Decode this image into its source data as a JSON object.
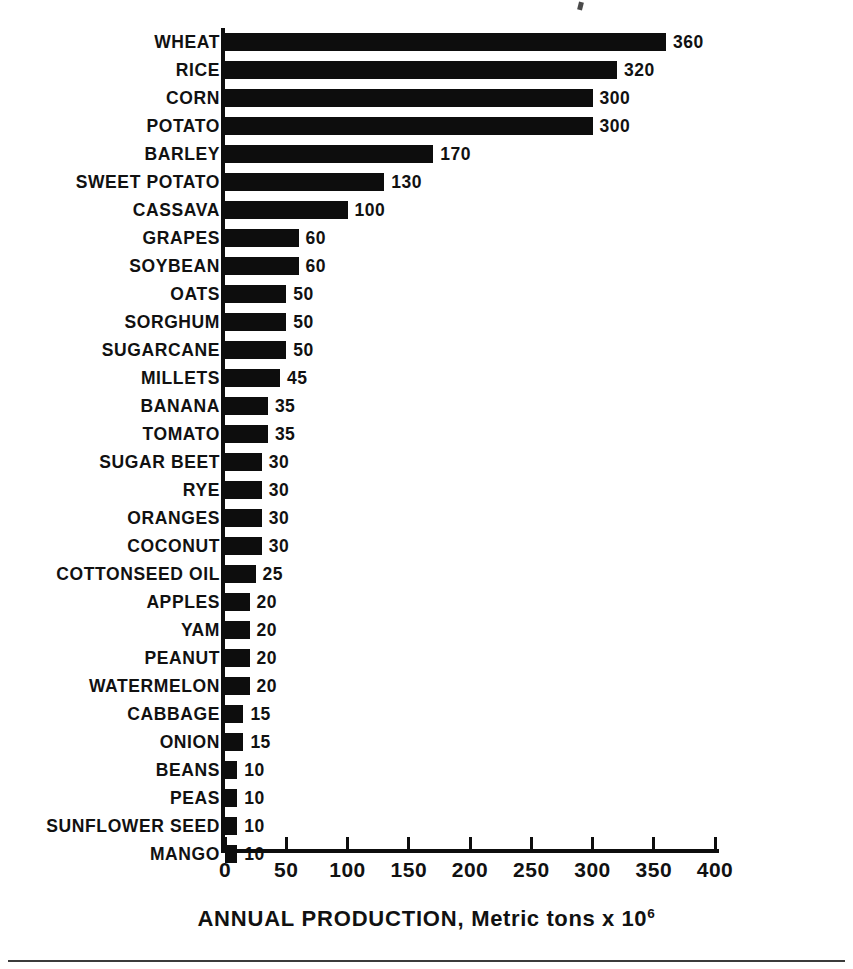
{
  "figure": {
    "background_color": "#ffffff",
    "bar_color": "#0d0d0d",
    "text_color": "#111111"
  },
  "axis": {
    "x_title_main": "ANNUAL PRODUCTION,",
    "x_title_unit": "Metric tons x 10",
    "x_title_exponent": "6",
    "ticks": [
      "0",
      "50",
      "100",
      "150",
      "200",
      "250",
      "300",
      "350",
      "400"
    ]
  },
  "chart_data": {
    "type": "bar",
    "orientation": "horizontal",
    "title": "",
    "subtitle": "",
    "xlabel": "ANNUAL PRODUCTION, Metric tons x 10^6",
    "ylabel": "",
    "xlim": [
      0,
      400
    ],
    "xticks": [
      0,
      50,
      100,
      150,
      200,
      250,
      300,
      350,
      400
    ],
    "grid": false,
    "legend": "none",
    "value_labels": true,
    "units": "million metric tons",
    "categories": [
      "WHEAT",
      "RICE",
      "CORN",
      "POTATO",
      "BARLEY",
      "SWEET POTATO",
      "CASSAVA",
      "GRAPES",
      "SOYBEAN",
      "OATS",
      "SORGHUM",
      "SUGARCANE",
      "MILLETS",
      "BANANA",
      "TOMATO",
      "SUGAR BEET",
      "RYE",
      "ORANGES",
      "COCONUT",
      "COTTONSEED OIL",
      "APPLES",
      "YAM",
      "PEANUT",
      "WATERMELON",
      "CABBAGE",
      "ONION",
      "BEANS",
      "PEAS",
      "SUNFLOWER SEED",
      "MANGO"
    ],
    "values": [
      360,
      320,
      300,
      300,
      170,
      130,
      100,
      60,
      60,
      50,
      50,
      50,
      45,
      35,
      35,
      30,
      30,
      30,
      30,
      25,
      20,
      20,
      20,
      20,
      15,
      15,
      10,
      10,
      10,
      10
    ],
    "value_label_text": [
      "360",
      "320",
      "300",
      "300",
      "170",
      "130",
      "100",
      "60",
      "60",
      "50",
      "50",
      "50",
      "45",
      "35",
      "35",
      "30",
      "30",
      "30",
      "30",
      "25",
      "20",
      "20",
      "20",
      "20",
      "15",
      "15",
      "10",
      "10",
      "10",
      "10"
    ]
  }
}
